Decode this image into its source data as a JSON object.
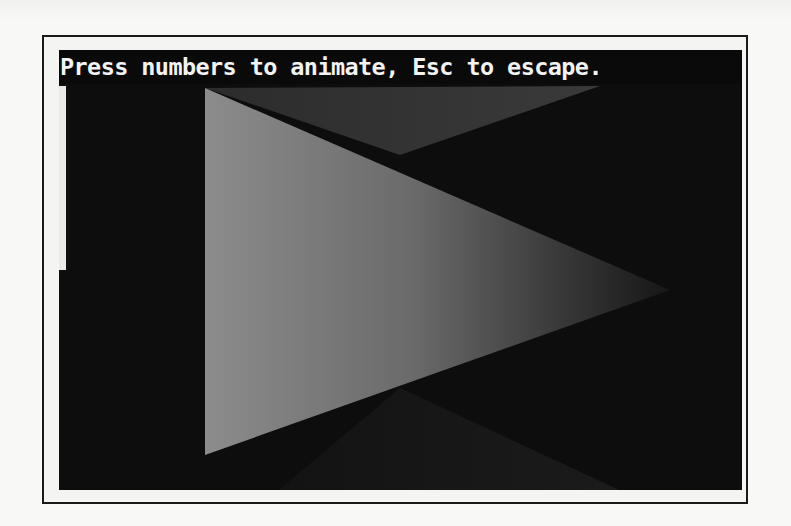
{
  "window": {
    "prompt_text": "Press numbers to animate, Esc to escape."
  },
  "scene": {
    "background_color": "#0d0d0d",
    "shapes": [
      {
        "name": "back-triangle-top",
        "points": "146,38 541,36 341,105",
        "fill_from": "#2a2a2a",
        "fill_to": "#3c3c3c"
      },
      {
        "name": "back-triangle-bottom",
        "points": "341,338 541,440 200,440",
        "fill_from": "#151515",
        "fill_to": "#1c1c1c"
      },
      {
        "name": "main-triangle",
        "points": "146,38 146,405 611,240",
        "fill_from": "#8a8a8a",
        "fill_to": "#1a1a1a"
      }
    ],
    "side_bar_color": "#e9e9e6"
  },
  "colors": {
    "page": "#f7f7f5",
    "frame_border": "#1a1a1a",
    "screen": "#0d0d0d",
    "text": "#f2f2f2"
  }
}
